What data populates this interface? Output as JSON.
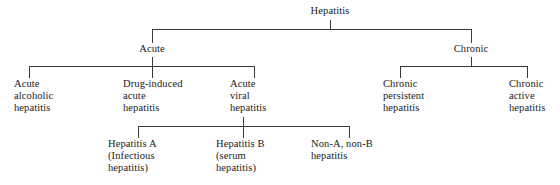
{
  "diagram": {
    "line_color": "#3a3a3a",
    "background": "#ffffff",
    "text_color": "#1a1a1a",
    "nodes": {
      "root": "Hepatitis",
      "acute": "Acute",
      "chronic": "Chronic",
      "acute_alcoholic": "Acute\nalcoholic\nhepatitis",
      "drug_induced": "Drug-induced\nacute\nhepatitis",
      "acute_viral": "Acute\nviral\nhepatitis",
      "chronic_persistent": "Chronic\npersistent\nhepatitis",
      "chronic_active": "Chronic\nactive\nhepatitis",
      "hepatitis_a": "Hepatitis A\n(Infectious\nhepatitis)",
      "hepatitis_b": "Hepatitis B\n(serum\nhepatitis)",
      "non_a_non_b": "Non-A, non-B\nhepatitis"
    }
  }
}
